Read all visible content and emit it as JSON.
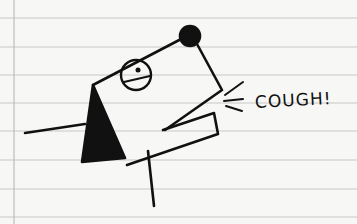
{
  "sketch": {
    "subject": "hand-drawn stick figure dog coughing on ruled notebook paper",
    "caption_text": "COUGH!",
    "colors": {
      "paper": "#f7f7f5",
      "rule_lines": "#c8c8c8",
      "ink": "#111111"
    }
  }
}
